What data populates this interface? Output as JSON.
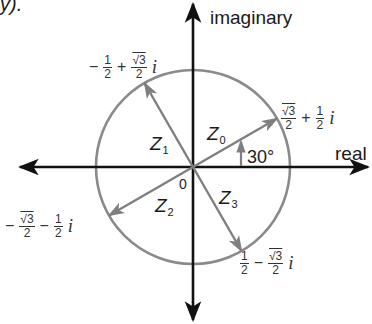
{
  "figure": {
    "corner_fragment": "y).",
    "axes": {
      "imaginary_label": "imaginary",
      "real_label": "real",
      "origin_label": "0"
    },
    "angle_label": "30°",
    "colors": {
      "axis": "#111111",
      "circle": "#8a8a8a",
      "vector": "#7f7f7f",
      "text": "#1a1a1a"
    },
    "vectors": [
      {
        "name": "Z",
        "sub": "0",
        "angle_deg": 30,
        "value": {
          "sign1": "",
          "f1_num": "√3",
          "f1_den": "2",
          "op": "+",
          "f2_num": "1",
          "f2_den": "2",
          "i": "i"
        }
      },
      {
        "name": "Z",
        "sub": "1",
        "angle_deg": 120,
        "value": {
          "sign1": "−",
          "f1_num": "1",
          "f1_den": "2",
          "op": "+",
          "f2_num": "√3",
          "f2_den": "2",
          "i": "i"
        }
      },
      {
        "name": "Z",
        "sub": "2",
        "angle_deg": 210,
        "value": {
          "sign1": "−",
          "f1_num": "√3",
          "f1_den": "2",
          "op": "−",
          "f2_num": "1",
          "f2_den": "2",
          "i": "i"
        }
      },
      {
        "name": "Z",
        "sub": "3",
        "angle_deg": 300,
        "value": {
          "sign1": "",
          "f1_num": "1",
          "f1_den": "2",
          "op": "−",
          "f2_num": "√3",
          "f2_den": "2",
          "i": "i"
        }
      }
    ]
  }
}
